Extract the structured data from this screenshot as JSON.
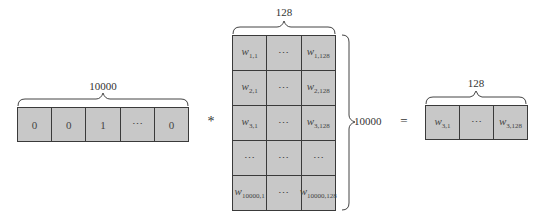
{
  "input_vector": {
    "size_label": "10000",
    "cells": [
      "0",
      "0",
      "1",
      "⋯",
      "0"
    ]
  },
  "operator": "*",
  "matrix": {
    "col_label": "128",
    "row_label": "10000",
    "rows": [
      [
        {
          "w": "w",
          "sub": "1,1"
        },
        {
          "text": "⋯"
        },
        {
          "w": "w",
          "sub": "1,128"
        }
      ],
      [
        {
          "w": "w",
          "sub": "2,1"
        },
        {
          "text": "⋯"
        },
        {
          "w": "w",
          "sub": "2,128"
        }
      ],
      [
        {
          "w": "w",
          "sub": "3,1"
        },
        {
          "text": "⋯"
        },
        {
          "w": "w",
          "sub": "3,128"
        }
      ],
      [
        {
          "text": "⋯"
        },
        {
          "text": "⋯"
        },
        {
          "text": "⋯"
        }
      ],
      [
        {
          "w": "w",
          "sub": "10000,1"
        },
        {
          "text": "⋯"
        },
        {
          "w": "w",
          "sub": "10000,128"
        }
      ]
    ]
  },
  "equals": "=",
  "output_vector": {
    "size_label": "128",
    "cells": [
      {
        "w": "w",
        "sub": "3,1"
      },
      {
        "text": "⋯"
      },
      {
        "w": "w",
        "sub": "3,128"
      }
    ]
  }
}
